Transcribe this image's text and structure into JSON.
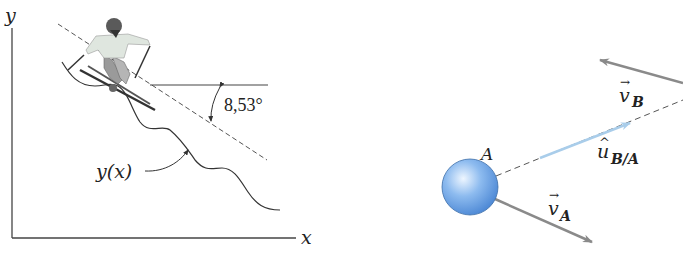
{
  "left_figure": {
    "axes": {
      "y_label": "y",
      "x_label": "x"
    },
    "curve_label": "y(x)",
    "angle_label": "8,53°",
    "subject": "skier"
  },
  "right_figure": {
    "particle_label": "A",
    "vectors": [
      {
        "id": "v_A",
        "symbol": "v",
        "subscript": "A",
        "accent": "→",
        "color": "#8a8a8a"
      },
      {
        "id": "v_B",
        "symbol": "v",
        "subscript": "B",
        "accent": "→",
        "color": "#8a8a8a"
      },
      {
        "id": "u_BA",
        "symbol": "u",
        "subscript": "B/A",
        "accent": "^",
        "color": "#a9cdea"
      }
    ],
    "colors": {
      "sphere": "#5d9be0",
      "sphere_highlight": "#e6f2ff",
      "vector_gray": "#8a8a8a",
      "unit_vector": "#a9cdea"
    }
  }
}
